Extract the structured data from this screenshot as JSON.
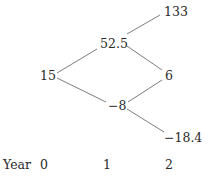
{
  "tree": {
    "nodes": {
      "root": "15",
      "up": "52.5",
      "down": "−8",
      "upup": "133",
      "updown": "6",
      "downdown": "−18.4"
    }
  },
  "axis": {
    "label": "Year",
    "ticks": [
      "0",
      "1",
      "2"
    ]
  }
}
